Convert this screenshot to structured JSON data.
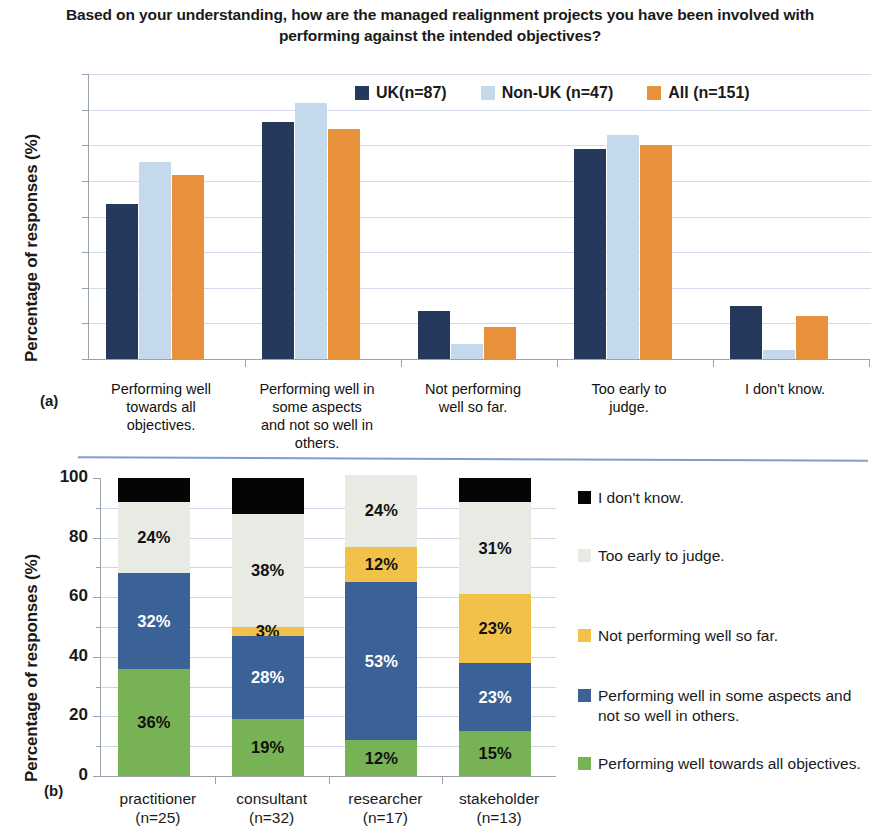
{
  "figure": {
    "title": "Based on your understanding, how are the managed realignment projects you have been involved with performing against the intended objectives?",
    "panel_a_letter": "(a)",
    "panel_b_letter": "(b)"
  },
  "colors": {
    "uk_navy": "#25395C",
    "nonuk_lightblue": "#C5D9EC",
    "all_orange": "#E8923C",
    "stack_green": "#77B255",
    "stack_blue": "#3B6296",
    "stack_yellow": "#F2C14A",
    "stack_lightgray": "#E8EAE4",
    "stack_black": "#050505",
    "grid": "#d3dced",
    "axis": "#9aa3ad",
    "divider": "#7e9dc9"
  },
  "chart_data": [
    {
      "type": "bar",
      "panel": "(a)",
      "title": "Based on your understanding, how are the managed realignment projects you have been involved with performing against the intended objectives?",
      "xlabel": "",
      "ylabel": "Percentage of responses (%)",
      "ylim": [
        0,
        40
      ],
      "yticks": [
        0,
        5,
        10,
        15,
        20,
        25,
        30,
        35,
        40
      ],
      "grid": true,
      "legend_position": "top-center",
      "categories": [
        "Performing well towards all objectives.",
        "Performing well in some aspects and not so well in others.",
        "Not performing well so far.",
        "Too early to judge.",
        "I don't know."
      ],
      "series": [
        {
          "name": "UK(n=87)",
          "color": "#25395C",
          "values": [
            21.7,
            33.2,
            6.7,
            29.5,
            7.5
          ]
        },
        {
          "name": "Non-UK (n=47)",
          "color": "#C5D9EC",
          "values": [
            27.7,
            36.0,
            2.1,
            31.5,
            1.3
          ]
        },
        {
          "name": "All (n=151)",
          "color": "#E8923C",
          "values": [
            25.8,
            32.3,
            4.5,
            30.0,
            6.0
          ]
        }
      ]
    },
    {
      "type": "bar",
      "subtype": "stacked",
      "panel": "(b)",
      "xlabel": "",
      "ylabel": "Percentage of responses (%)",
      "ylim": [
        0,
        100
      ],
      "yticks": [
        0,
        20,
        40,
        60,
        80,
        100
      ],
      "minor_yticks": [
        10,
        30,
        50,
        70,
        90
      ],
      "grid": true,
      "legend_position": "right",
      "categories": [
        "practitioner (n=25)",
        "consultant (n=32)",
        "researcher (n=17)",
        "stakeholder (n=13)"
      ],
      "category_lines": [
        [
          "practitioner",
          "(n=25)"
        ],
        [
          "consultant",
          "(n=32)"
        ],
        [
          "researcher",
          "(n=17)"
        ],
        [
          "stakeholder",
          "(n=13)"
        ]
      ],
      "series": [
        {
          "name": "Performing well towards all objectives.",
          "color": "#77B255",
          "text_color": "#111111",
          "values": [
            36,
            19,
            12,
            15
          ],
          "labels": [
            "36%",
            "19%",
            "12%",
            "15%"
          ]
        },
        {
          "name": "Performing well in some aspects and not so well in others.",
          "color": "#3B6296",
          "text_color": "#ffffff",
          "values": [
            32,
            28,
            53,
            23
          ],
          "labels": [
            "32%",
            "28%",
            "53%",
            "23%"
          ]
        },
        {
          "name": "Not performing well so far.",
          "color": "#F2C14A",
          "text_color": "#111111",
          "values": [
            0,
            3,
            12,
            23
          ],
          "labels": [
            "",
            "3%",
            "12%",
            "23%"
          ]
        },
        {
          "name": "Too early to judge.",
          "color": "#E8EAE4",
          "text_color": "#111111",
          "values": [
            24,
            38,
            24,
            31
          ],
          "labels": [
            "24%",
            "38%",
            "24%",
            "31%"
          ]
        },
        {
          "name": "I don't know.",
          "color": "#050505",
          "text_color": "#ffffff",
          "values": [
            8,
            12,
            0,
            8
          ],
          "labels": [
            "",
            "",
            "",
            ""
          ]
        }
      ]
    }
  ],
  "chart_a": {
    "ylabel": "Percentage of responses (%)",
    "yticks": [
      "40",
      "35",
      "30",
      "25",
      "20",
      "15",
      "10",
      "5",
      "0"
    ],
    "legend": [
      {
        "label": "UK(n=87)",
        "color": "#25395C"
      },
      {
        "label": "Non-UK (n=47)",
        "color": "#C5D9EC"
      },
      {
        "label": "All (n=151)",
        "color": "#E8923C"
      }
    ],
    "xlabels": [
      [
        "Performing well",
        "towards all",
        "objectives."
      ],
      [
        "Performing well in",
        "some aspects",
        "and not so well in",
        "others."
      ],
      [
        "Not performing",
        "well so far."
      ],
      [
        "Too early to",
        "judge."
      ],
      [
        "I don't know."
      ]
    ]
  },
  "chart_b": {
    "ylabel": "Percentage of responses (%)",
    "yticks": [
      "100",
      "80",
      "60",
      "40",
      "20",
      "0"
    ],
    "legend": [
      {
        "label": "I don't know.",
        "color": "#050505"
      },
      {
        "label": "Too early to judge.",
        "color": "#E8EAE4"
      },
      {
        "label": "Not performing well so far.",
        "color": "#F2C14A"
      },
      {
        "label": "Performing well in some aspects and not so well in others.",
        "color": "#3B6296"
      },
      {
        "label": "Performing well towards all objectives.",
        "color": "#77B255"
      }
    ]
  }
}
